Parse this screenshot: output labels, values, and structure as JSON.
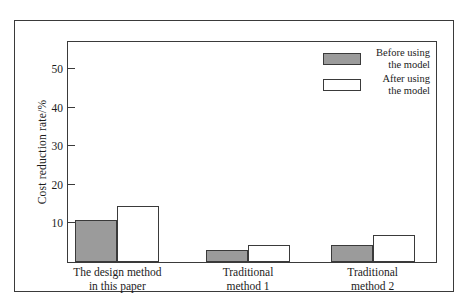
{
  "chart_data": {
    "type": "bar",
    "title": "",
    "xlabel": "",
    "ylabel": "Cost reduction rate/%",
    "categories": [
      "The design method\nin this paper",
      "Traditional\nmethod 1",
      "Traditional\nmethod 2"
    ],
    "category_lines": [
      [
        "The design method",
        "in this paper"
      ],
      [
        "Traditional",
        "method 1"
      ],
      [
        "Traditional",
        "method 2"
      ]
    ],
    "series": [
      {
        "name": "Before using the model",
        "name_lines": [
          "Before using",
          "the model"
        ],
        "color": "#9b9b9b",
        "values": [
          11,
          3,
          4.5
        ]
      },
      {
        "name": "After using the model",
        "name_lines": [
          "After using",
          "the model"
        ],
        "color": "#ffffff",
        "values": [
          14.5,
          4.5,
          7
        ]
      }
    ],
    "ylim": [
      0,
      57
    ],
    "yticks": [
      10,
      20,
      30,
      40,
      50
    ],
    "ytick_labels": [
      "10",
      "20",
      "30",
      "40",
      "50"
    ],
    "grid": false,
    "legend_position": "top-right",
    "axis_color": "#3a3a3a",
    "bar_edge_color": "#3a3a3a",
    "background": "#ffffff"
  }
}
